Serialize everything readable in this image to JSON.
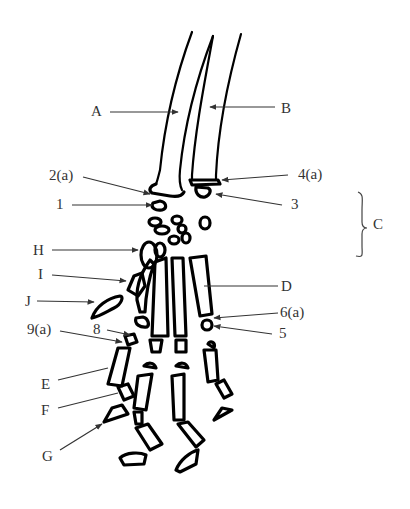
{
  "figure": {
    "type": "anatomical-diagram",
    "colors": {
      "ink": "#000000",
      "label": "#333333",
      "background": "#ffffff"
    }
  },
  "labels": {
    "A": "A",
    "B": "B",
    "C": "C",
    "D": "D",
    "E": "E",
    "F": "F",
    "G": "G",
    "H": "H",
    "I": "I",
    "J": "J",
    "n1": "1",
    "n2a": "2(a)",
    "n3": "3",
    "n4a": "4(a)",
    "n5": "5",
    "n6a": "6(a)",
    "n8": "8",
    "n9a": "9(a)"
  }
}
